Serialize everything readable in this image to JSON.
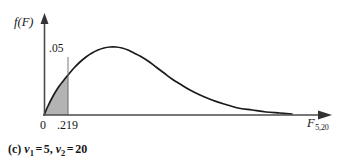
{
  "figure": {
    "caption_prefix": "(c)",
    "caption_nu1_sub": "1",
    "caption_nu2_sub": "2",
    "caption_nu1_value": "5",
    "caption_nu2_value": "20",
    "caption_equals": "=",
    "caption_comma": ",",
    "nu_symbol": "ν",
    "y_axis_label": "f(F)",
    "x_axis_label_base": "F",
    "x_axis_label_sub": "5,20",
    "area_label": ".05",
    "tick_zero": "0",
    "tick_critical": ".219"
  },
  "chart_data": {
    "type": "area",
    "title": "",
    "subtitle": "",
    "xlabel": "F_5,20",
    "ylabel": "f(F)",
    "grid": false,
    "legend": null,
    "distribution": "F distribution density",
    "df1": 5,
    "df2": 20,
    "tail": "lower",
    "shaded_area": 0.05,
    "critical_value": 0.219,
    "axis_tick_values": [
      0,
      0.219
    ],
    "annotations": [
      {
        "text": ".05",
        "points_to": "shaded region under curve left of .219"
      }
    ],
    "curve_points_px": [
      [
        44,
        115
      ],
      [
        48,
        106
      ],
      [
        52,
        98
      ],
      [
        56,
        91
      ],
      [
        60,
        85
      ],
      [
        64,
        80
      ],
      [
        68,
        75
      ],
      [
        74,
        68
      ],
      [
        80,
        62
      ],
      [
        86,
        57
      ],
      [
        92,
        53
      ],
      [
        98,
        50
      ],
      [
        104,
        48
      ],
      [
        110,
        47
      ],
      [
        116,
        47
      ],
      [
        122,
        48
      ],
      [
        128,
        50
      ],
      [
        134,
        53
      ],
      [
        140,
        56
      ],
      [
        148,
        61
      ],
      [
        156,
        67
      ],
      [
        164,
        73
      ],
      [
        172,
        79
      ],
      [
        180,
        84
      ],
      [
        190,
        90
      ],
      [
        200,
        95
      ],
      [
        212,
        100
      ],
      [
        224,
        104
      ],
      [
        238,
        108
      ],
      [
        252,
        110
      ],
      [
        266,
        112
      ],
      [
        280,
        113
      ],
      [
        292,
        114
      ]
    ],
    "shade_x_range_px": [
      44,
      68
    ],
    "axis_origin_px": [
      44,
      115
    ],
    "y_axis_top_px": 16,
    "x_axis_end_px": 330,
    "colors": {
      "curve": "#1a1a1a",
      "axis": "#4a4a4a",
      "shade_fill": "#b3b3b3",
      "shade_stroke": "#7a7a7a",
      "background": "#ffffff",
      "text": "#161616"
    }
  }
}
